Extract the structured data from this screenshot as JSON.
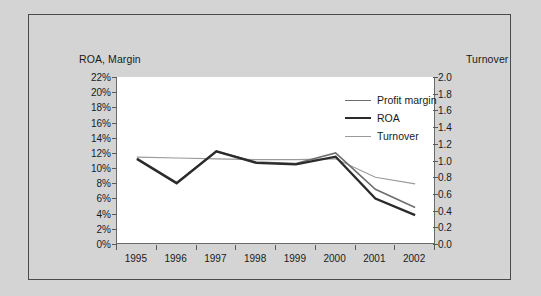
{
  "chart_data": {
    "type": "line",
    "title": "",
    "xlabel": "",
    "ylabel": "ROA, Margin",
    "y2label": "Turnover",
    "categories": [
      "1995",
      "1996",
      "1997",
      "1998",
      "1999",
      "2000",
      "2001",
      "2002"
    ],
    "ylim": [
      0,
      22
    ],
    "y2lim": [
      0,
      2.0
    ],
    "yticks": [
      "0%",
      "2%",
      "4%",
      "6%",
      "8%",
      "10%",
      "12%",
      "14%",
      "16%",
      "18%",
      "20%",
      "22%"
    ],
    "ytick_values": [
      0,
      2,
      4,
      6,
      8,
      10,
      12,
      14,
      16,
      18,
      20,
      22
    ],
    "y2ticks": [
      "0.0",
      "0.2",
      "0.4",
      "0.6",
      "0.8",
      "1.0",
      "1.2",
      "1.4",
      "1.6",
      "1.8",
      "2.0"
    ],
    "y2tick_values": [
      0.0,
      0.2,
      0.4,
      0.6,
      0.8,
      1.0,
      1.2,
      1.4,
      1.6,
      1.8,
      2.0
    ],
    "grid": false,
    "legend_position": "upper right",
    "series": [
      {
        "name": "Profit margin",
        "axis": "left",
        "color": "#6e6e6e",
        "width": 1.6,
        "values": [
          11.3,
          8.1,
          12.2,
          10.8,
          10.6,
          12.0,
          7.2,
          4.8
        ]
      },
      {
        "name": "ROA",
        "axis": "left",
        "color": "#2b2b2b",
        "width": 2.3,
        "values": [
          11.2,
          8.0,
          12.2,
          10.7,
          10.5,
          11.5,
          6.0,
          3.8
        ]
      },
      {
        "name": "Turnover",
        "axis": "right",
        "color": "#9a9a9a",
        "width": 1.1,
        "values": [
          1.04,
          1.03,
          1.02,
          1.01,
          1.01,
          1.02,
          0.8,
          0.72
        ]
      }
    ]
  },
  "axis_titles": {
    "left": "ROA, Margin",
    "right": "Turnover"
  },
  "legend": {
    "items": [
      {
        "label": "Profit margin",
        "color": "#6e6e6e",
        "width": 1.6
      },
      {
        "label": "ROA",
        "color": "#2b2b2b",
        "width": 2.3
      },
      {
        "label": "Turnover",
        "color": "#9a9a9a",
        "width": 1.1
      }
    ]
  },
  "colors": {
    "figure_background": "#d4d4d4",
    "plot_background": "#ffffff",
    "frame_border": "#4a4a4a",
    "axis_line": "#6a6a6a",
    "text": "#1a1a1a"
  }
}
